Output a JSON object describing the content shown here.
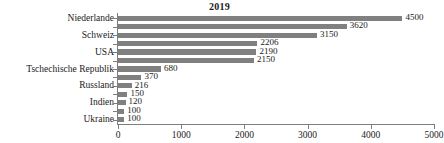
{
  "chart_data": {
    "type": "bar",
    "orientation": "horizontal",
    "title": "2019",
    "xlabel": "",
    "ylabel": "",
    "xlim": [
      0,
      5000
    ],
    "xticks": [
      0,
      1000,
      2000,
      3000,
      4000,
      5000
    ],
    "xtick_labels": [
      "0",
      "1000",
      "2000",
      "3000",
      "4000",
      "5000"
    ],
    "grid": false,
    "legend": false,
    "bar_color": "#808080",
    "axis_color": "#7d7d7d",
    "categories": [
      "Niederlande",
      "",
      "Schweiz",
      "",
      "USA",
      "",
      "Tschechische Republik",
      "",
      "Russland",
      "",
      "Indien",
      "",
      "Ukraine"
    ],
    "values": [
      4500,
      3620,
      3150,
      2206,
      2190,
      2150,
      680,
      370,
      216,
      150,
      120,
      100,
      100
    ],
    "data_labels": [
      "4500",
      "3620",
      "3150",
      "2206",
      "2190",
      "2150",
      "680",
      "370",
      "216",
      "150",
      "120",
      "100",
      "100"
    ],
    "visible_category_labels": [
      "Niederlande",
      "Schweiz",
      "USA",
      "Tschechische Republik",
      "Russland",
      "Indien",
      "Ukraine"
    ]
  }
}
